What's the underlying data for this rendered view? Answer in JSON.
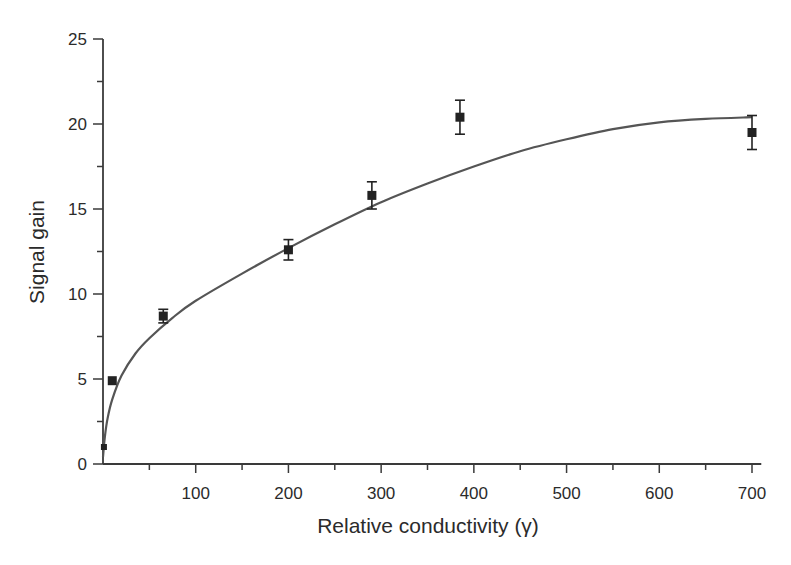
{
  "chart_data": {
    "type": "scatter",
    "title": "",
    "xlabel": "Relative conductivity (γ)",
    "ylabel": "Signal gain",
    "xlim": [
      0,
      710
    ],
    "ylim": [
      0,
      25
    ],
    "grid": false,
    "legend": null,
    "x_ticks": [
      100,
      200,
      300,
      400,
      500,
      600,
      700
    ],
    "x_tick_labels": [
      "100",
      "200",
      "300",
      "400",
      "500",
      "600",
      "700"
    ],
    "x_minor_step": 50,
    "y_ticks": [
      0,
      5,
      10,
      15,
      20,
      25
    ],
    "y_tick_labels": [
      "0",
      "5",
      "10",
      "15",
      "20",
      "25"
    ],
    "y_minor_step": 2.5,
    "series": [
      {
        "name": "Measured",
        "kind": "scatter-errorbar",
        "marker": "square",
        "color": "#222222",
        "points": [
          {
            "x": 1,
            "y": 1.0,
            "err": 0.0
          },
          {
            "x": 10,
            "y": 4.9,
            "err": 0.0
          },
          {
            "x": 65,
            "y": 8.7,
            "err": 0.4
          },
          {
            "x": 200,
            "y": 12.6,
            "err": 0.6
          },
          {
            "x": 290,
            "y": 15.8,
            "err": 0.8
          },
          {
            "x": 385,
            "y": 20.4,
            "err": 1.0
          },
          {
            "x": 700,
            "y": 19.5,
            "err": 1.0
          }
        ]
      },
      {
        "name": "Fit",
        "kind": "line",
        "color": "#555555",
        "points": [
          {
            "x": 0,
            "y": 0.4
          },
          {
            "x": 2,
            "y": 1.6
          },
          {
            "x": 5,
            "y": 2.7
          },
          {
            "x": 10,
            "y": 3.8
          },
          {
            "x": 20,
            "y": 5.2
          },
          {
            "x": 35,
            "y": 6.5
          },
          {
            "x": 50,
            "y": 7.4
          },
          {
            "x": 75,
            "y": 8.6
          },
          {
            "x": 100,
            "y": 9.6
          },
          {
            "x": 150,
            "y": 11.2
          },
          {
            "x": 200,
            "y": 12.7
          },
          {
            "x": 250,
            "y": 14.1
          },
          {
            "x": 300,
            "y": 15.4
          },
          {
            "x": 350,
            "y": 16.5
          },
          {
            "x": 400,
            "y": 17.5
          },
          {
            "x": 450,
            "y": 18.4
          },
          {
            "x": 500,
            "y": 19.1
          },
          {
            "x": 550,
            "y": 19.7
          },
          {
            "x": 600,
            "y": 20.1
          },
          {
            "x": 650,
            "y": 20.3
          },
          {
            "x": 700,
            "y": 20.4
          }
        ]
      }
    ]
  },
  "layout": {
    "plot_left": 103,
    "plot_right_x700": 752,
    "plot_top_y25": 39,
    "plot_bottom_y0": 464,
    "axis_color": "#3a3a3a"
  }
}
